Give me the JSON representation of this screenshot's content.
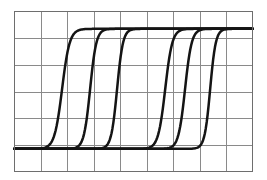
{
  "figure": {
    "background_color": "#ffffff",
    "curve_color": "#141414",
    "grid_color": "#8a8a8a",
    "border_color": "#6e6e6e"
  },
  "chart_data": {
    "type": "line",
    "title": "",
    "subtitle": "",
    "xlabel": "",
    "ylabel": "",
    "xlim": [
      0,
      9
    ],
    "ylim": [
      0,
      6
    ],
    "grid": true,
    "grid_columns": 9,
    "grid_rows": 6,
    "legend": "none",
    "annotations": [],
    "xtick_labels": [],
    "ytick_labels": [],
    "baseline_y": 0.85,
    "plateau_y": 5.35,
    "series": [
      {
        "name": "curve-1",
        "midpoint_x": 1.8,
        "steepness": 7.0,
        "low": 0.85,
        "high": 5.35
      },
      {
        "name": "curve-2",
        "midpoint_x": 2.86,
        "steepness": 8.5,
        "low": 0.85,
        "high": 5.35
      },
      {
        "name": "curve-3",
        "midpoint_x": 3.88,
        "steepness": 9.0,
        "low": 0.85,
        "high": 5.35
      },
      {
        "name": "curve-4",
        "midpoint_x": 5.7,
        "steepness": 7.5,
        "low": 0.85,
        "high": 5.35
      },
      {
        "name": "curve-5",
        "midpoint_x": 6.45,
        "steepness": 8.0,
        "low": 0.85,
        "high": 5.35
      },
      {
        "name": "curve-6",
        "midpoint_x": 7.4,
        "steepness": 9.5,
        "low": 0.85,
        "high": 5.35
      }
    ]
  }
}
